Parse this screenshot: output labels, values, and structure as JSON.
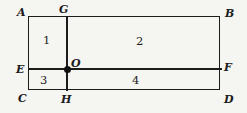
{
  "figure": {
    "colors": {
      "background": "#f5f5f2",
      "line": "#1c1c1c",
      "dot": "#111111"
    },
    "points": [
      {
        "name": "A"
      },
      {
        "name": "G"
      },
      {
        "name": "B"
      },
      {
        "name": "E"
      },
      {
        "name": "O"
      },
      {
        "name": "F"
      },
      {
        "name": "C"
      },
      {
        "name": "H"
      },
      {
        "name": "D"
      }
    ],
    "regions": [
      {
        "label": "1"
      },
      {
        "label": "2"
      },
      {
        "label": "3"
      },
      {
        "label": "4"
      }
    ]
  }
}
